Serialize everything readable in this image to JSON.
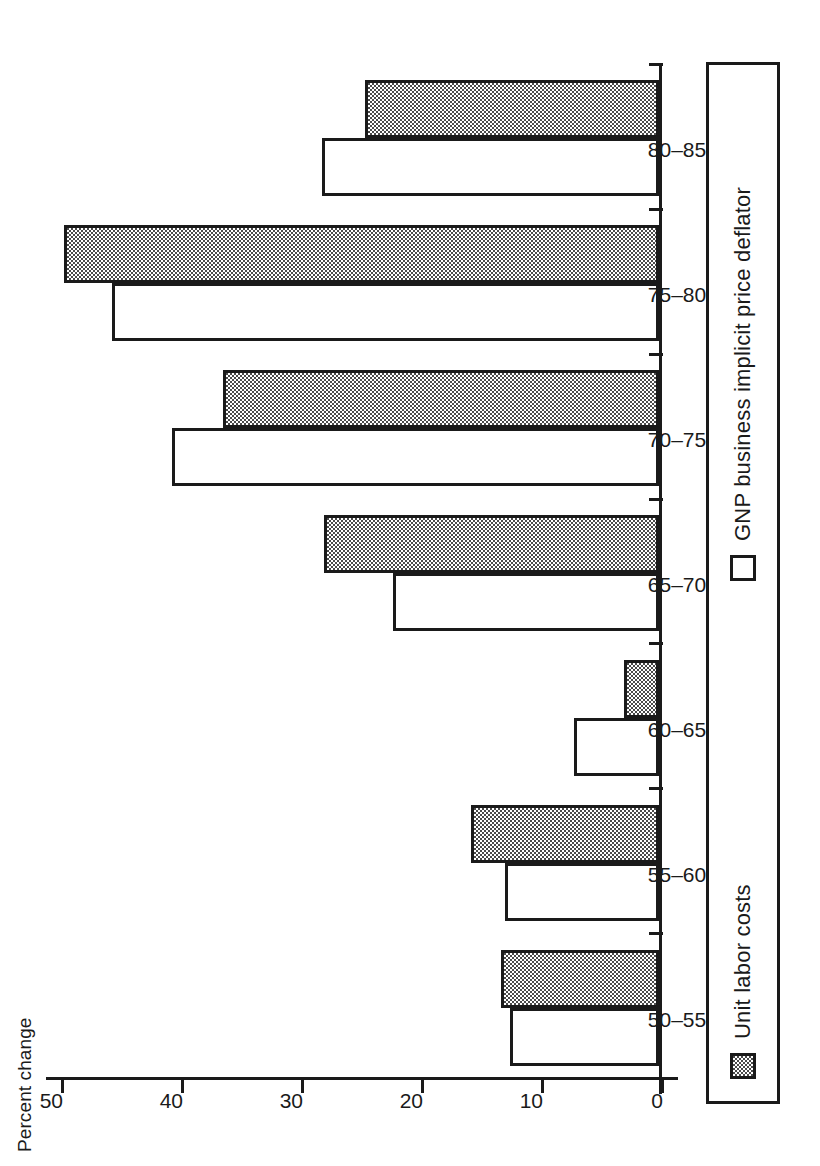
{
  "chart_data": {
    "type": "bar",
    "orientation": "horizontal",
    "title": "",
    "xlabel": "",
    "ylabel": "Percent change",
    "axis_caption": "Percent change",
    "categories": [
      "50–55",
      "55–60",
      "60–65",
      "65–70",
      "70–75",
      "75–80",
      "80–85"
    ],
    "tick_labels": [
      "50",
      "40",
      "30",
      "20",
      "10",
      "0"
    ],
    "tick_values": [
      50,
      40,
      30,
      20,
      10,
      0
    ],
    "ylim": [
      0,
      50
    ],
    "grid": false,
    "legend_position": "bottom",
    "series": [
      {
        "name": "Unit labor costs",
        "fill": "shaded",
        "color": "#a8a8a8",
        "values": [
          13.2,
          15.7,
          2.9,
          27.9,
          36.3,
          49.6,
          24.5
        ]
      },
      {
        "name": "GNP business implicit price deflator",
        "fill": "white",
        "color": "#ffffff",
        "values": [
          12.4,
          12.8,
          7.1,
          22.2,
          40.6,
          45.6,
          28.1
        ]
      }
    ]
  },
  "legend": {
    "items": [
      {
        "label": "Unit labor costs",
        "swatch": "shaded-square-icon"
      },
      {
        "label": "GNP business implicit price deflator",
        "swatch": "white-square-icon"
      }
    ]
  },
  "colors": {
    "ink": "#1a1a1a",
    "background": "#ffffff",
    "shaded_fill": "#a8a8a8"
  }
}
